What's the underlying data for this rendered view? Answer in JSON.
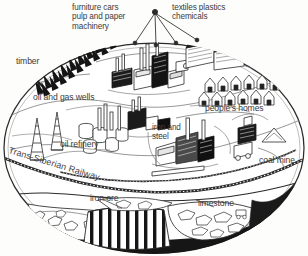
{
  "figure": {
    "kind": "cutaway-oval-illustration",
    "style": "pen-and-ink line drawing, black on off-white",
    "colors": {
      "background": "#fdfdfb",
      "ink": "#2b2b2b",
      "label_text": "#3b3b3b",
      "shadow_fill": "#1a1a1a"
    }
  },
  "labels": {
    "products_left": "furniture cars\npulp and paper\nmachinery",
    "products_right": "textiles plastics\nchemicals",
    "timber": "timber",
    "oil_and_gas_wells": "oil and gas wells",
    "peoples_homes": "people's homes",
    "oil_refinery": "oil refinery",
    "iron_and_steel": "iron and\nsteel",
    "railway": "Trans-Siberian Railway",
    "coal_mine": "coal mine",
    "iron_ore": "iron ore",
    "limestone": "limestone"
  },
  "scene_elements": {
    "apex_node": "product-output-hub",
    "connector_count": 4,
    "surface_features": [
      "conifer-forest-belt",
      "oil-derricks",
      "refinery-tanks",
      "factory-complex",
      "steelworks",
      "housing-row",
      "coal-mine-headgear",
      "railway-track"
    ],
    "underground_features": [
      "iron-ore-seam",
      "coal-seams",
      "limestone-deposit"
    ]
  }
}
